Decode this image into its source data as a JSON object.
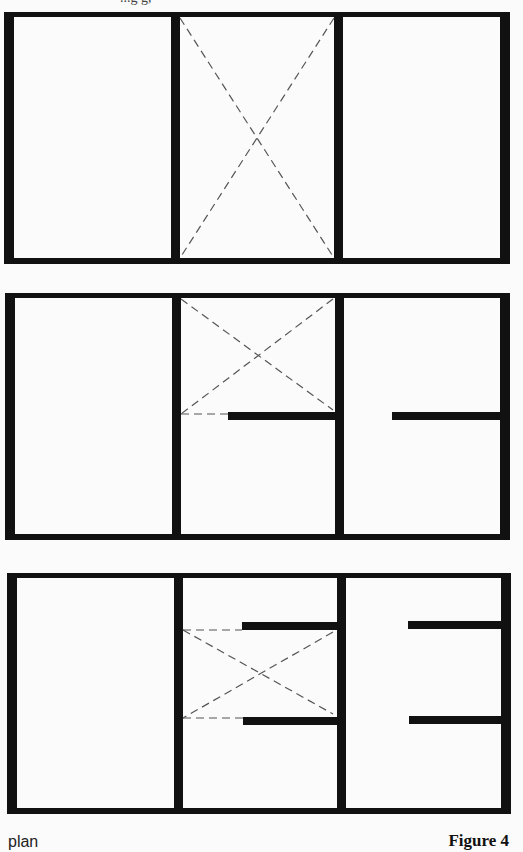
{
  "figure": {
    "caption_left": "plan",
    "caption_right": "Figure 4",
    "top_fragment": "...g g,",
    "colors": {
      "wall": "#111111",
      "dashed_line": "#555555",
      "background": "#fbfbfb"
    },
    "panels": [
      {
        "id": "panel-1",
        "description": "Three bays, middle bay fully open (dashed X across full height)",
        "bays": 3,
        "wall_stubs": [],
        "open_areas": [
          "middle bay full height"
        ]
      },
      {
        "id": "panel-2",
        "description": "Three bays, middle bay open above one partial wall stub; right bay has one wall stub",
        "bays": 3,
        "wall_stubs": [
          "middle bay at mid-height",
          "right bay at mid-height"
        ],
        "open_areas": [
          "middle bay upper half"
        ]
      },
      {
        "id": "panel-3",
        "description": "Three bays, middle bay open between two partial wall stubs; right bay has two wall stubs",
        "bays": 3,
        "wall_stubs": [
          "middle bay upper",
          "middle bay lower",
          "right bay upper",
          "right bay lower"
        ],
        "open_areas": [
          "middle bay central band"
        ]
      }
    ]
  }
}
